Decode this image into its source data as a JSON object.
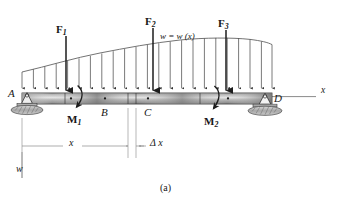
{
  "figure": {
    "caption": "(a)",
    "title_type": "beam-distributed-load-free-body-diagram"
  },
  "beam": {
    "label_left_support": "A",
    "label_point_b": "B",
    "label_point_c": "C",
    "label_right_support": "D",
    "left_x": 22,
    "right_x": 272,
    "top_y": 93,
    "height": 11,
    "segment_breaks": [
      65,
      128,
      136,
      200
    ],
    "dot_markers": [
      71,
      105,
      148,
      228
    ],
    "fill_light": "#cfcfcf",
    "fill_mid": "#9a9a9a",
    "fill_dark": "#6e6e6e",
    "stroke": "#2a2a2a"
  },
  "supports": {
    "left": {
      "name": "A",
      "type": "pin",
      "x": 27,
      "ground_y": 112
    },
    "right": {
      "name": "D",
      "type": "pin",
      "x": 265,
      "ground_y": 112
    },
    "hatch_color": "#b9b9b9",
    "stroke": "#333333"
  },
  "axis": {
    "label": "x",
    "label_x": 322,
    "label_y": 91,
    "line_from_x": 272,
    "line_to_x": 316,
    "line_y": 97,
    "color": "#555555"
  },
  "distributed_load": {
    "equation_label": "w = w (x)",
    "equation_x": 178,
    "equation_y": 36,
    "w_axis_label": "w",
    "w_axis_label_x": 19,
    "w_axis_label_y": 170,
    "arrow_count": 23,
    "arrow_start_x": 22,
    "arrow_end_x": 272,
    "arrow_tip_y": 89,
    "curve_points": [
      {
        "x": 22,
        "y": 72
      },
      {
        "x": 60,
        "y": 62
      },
      {
        "x": 100,
        "y": 53
      },
      {
        "x": 140,
        "y": 45
      },
      {
        "x": 180,
        "y": 40
      },
      {
        "x": 220,
        "y": 38
      },
      {
        "x": 250,
        "y": 39
      },
      {
        "x": 272,
        "y": 44
      }
    ],
    "color": "#4a4a4a"
  },
  "point_forces": [
    {
      "name": "F",
      "subscript": "1",
      "x": 66,
      "label_x": 57,
      "label_y": 28,
      "arrow_top_y": 36,
      "arrow_tip_y": 91
    },
    {
      "name": "F",
      "subscript": "2",
      "x": 153,
      "label_x": 145,
      "label_y": 20,
      "arrow_top_y": 28,
      "arrow_tip_y": 91
    },
    {
      "name": "F",
      "subscript": "3",
      "x": 226,
      "label_x": 218,
      "label_y": 22,
      "arrow_top_y": 30,
      "arrow_tip_y": 91
    }
  ],
  "moments": [
    {
      "name": "M",
      "subscript": "1",
      "label_x": 68,
      "label_y": 118,
      "pivot_x": 80,
      "pivot_y": 100
    },
    {
      "name": "M",
      "subscript": "2",
      "label_x": 205,
      "label_y": 120,
      "pivot_x": 216,
      "pivot_y": 100
    }
  ],
  "dimensions": [
    {
      "label": "x",
      "label_x": 71,
      "label_y": 140,
      "from_x": 22,
      "to_x": 128,
      "line_y": 146
    },
    {
      "label": "Δ x",
      "label_x": 148,
      "label_y": 140,
      "from_x": 136,
      "to_x": 144,
      "line_y": 146
    }
  ],
  "extension_lines": [
    {
      "x": 22,
      "from_y": 118,
      "to_y": 160
    },
    {
      "x": 128,
      "from_y": 108,
      "to_y": 158
    },
    {
      "x": 136,
      "from_y": 108,
      "to_y": 158
    }
  ],
  "colors": {
    "ink": "#171717",
    "line": "#4a4a4a",
    "thin_line": "#8a8a8a",
    "background": "#ffffff"
  }
}
